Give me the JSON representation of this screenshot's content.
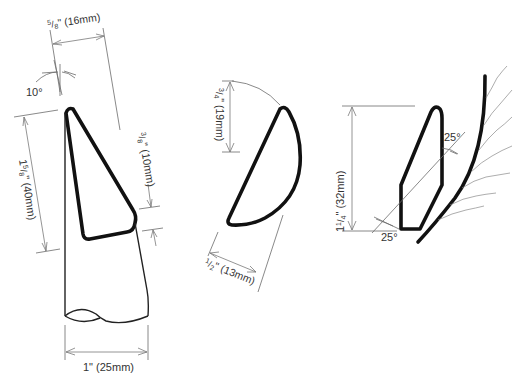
{
  "diagram": {
    "top_strip_text": "",
    "colors": {
      "outline": "#111111",
      "dimension_line": "#7a7a7a",
      "label": "#333333",
      "background": "#ffffff"
    },
    "tool_profiles": [
      {
        "id": "skew-chisel",
        "labels": {
          "tip_width": "5/8\" (16mm)",
          "tip_width_num": "5",
          "tip_width_den": "8",
          "tip_width_rest": "\" (16mm)",
          "tip_angle": "10°",
          "bevel_length": "1 5/8\" (40mm)",
          "bevel_length_int": "1",
          "bevel_length_num": "5",
          "bevel_length_den": "8",
          "bevel_length_rest": "\" (40mm)",
          "heel": "3/8\" (10mm)",
          "heel_num": "3",
          "heel_den": "8",
          "heel_rest": "\" (10mm)",
          "shaft_width": "1\" (25mm)"
        }
      },
      {
        "id": "half-round-profile",
        "labels": {
          "height": "3/4\" (19mm)",
          "height_num": "3",
          "height_den": "4",
          "height_rest": "\" (19mm)",
          "width": "1/2\" (13mm)",
          "width_num": "1",
          "width_den": "2",
          "width_rest": "\" (13mm)"
        }
      },
      {
        "id": "cutting-profile",
        "labels": {
          "length": "1 1/4\" (32mm)",
          "length_int": "1",
          "length_num": "1",
          "length_den": "4",
          "length_rest": "\" (32mm)",
          "upper_angle": "25°",
          "lower_angle": "25°"
        }
      }
    ]
  }
}
